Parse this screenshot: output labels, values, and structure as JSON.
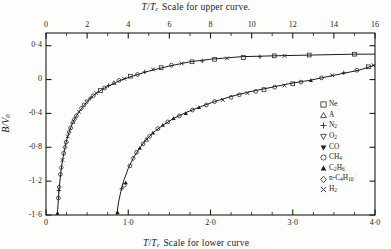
{
  "figure": {
    "top_axis_title": "Scale for upper curve.",
    "bottom_axis_title": "Scale for lower curve",
    "axis_symbol_numerator": "T",
    "axis_symbol_denominator": "T",
    "axis_symbol_denominator_sub": "c",
    "ylabel_numerator": "B",
    "ylabel_denominator": "V",
    "ylabel_denominator_sub": "0"
  },
  "legend": {
    "entries": [
      {
        "symbol": "open-square",
        "label": "Ne"
      },
      {
        "symbol": "open-triangle-up",
        "label": "A"
      },
      {
        "symbol": "plus",
        "label": "N2"
      },
      {
        "symbol": "open-triangle-down",
        "label": "O2"
      },
      {
        "symbol": "filled-triangle-down",
        "label": "CO"
      },
      {
        "symbol": "open-circle",
        "label": "CH4"
      },
      {
        "symbol": "filled-triangle-up",
        "label": "C2H6"
      },
      {
        "symbol": "open-diamond",
        "label": "n-C4H10"
      },
      {
        "symbol": "cross",
        "label": "H2"
      }
    ]
  },
  "chart_data": {
    "type": "scatter",
    "xlabel": "T/Tc",
    "ylabel": "B/V0",
    "grid": false,
    "legend_position": "right",
    "axes": {
      "top": {
        "label": "T/Tc Scale for upper curve.",
        "range": [
          0,
          16
        ],
        "ticks": [
          0,
          2,
          4,
          6,
          8,
          10,
          12,
          14,
          16
        ],
        "tick_labels": [
          "0",
          "2",
          "4",
          "6",
          "8",
          "10",
          "12",
          "14",
          "16"
        ],
        "minor_tick_step": 1
      },
      "bottom": {
        "label": "T/Tc Scale for lower curve",
        "range": [
          0,
          4
        ],
        "ticks": [
          0,
          1.0,
          2.0,
          3.0,
          4.0
        ],
        "tick_labels": [
          "0",
          "1·0",
          "2·0",
          "3·0",
          "4·0"
        ],
        "minor_tick_step": 0.25
      },
      "left": {
        "label": "B/V0",
        "range": [
          -1.6,
          0.55
        ],
        "ticks": [
          0.4,
          0,
          -0.4,
          -0.8,
          -1.2,
          -1.6
        ],
        "tick_labels": [
          "0·4",
          "0",
          "-0·4",
          "-0·8",
          "-1·2",
          "-1·6"
        ]
      }
    },
    "series": [
      {
        "name": "upper curve",
        "axis": "top",
        "line": [
          [
            0.55,
            -1.6
          ],
          [
            0.6,
            -1.42
          ],
          [
            0.65,
            -1.26
          ],
          [
            0.72,
            -1.1
          ],
          [
            0.8,
            -0.96
          ],
          [
            0.9,
            -0.83
          ],
          [
            1.0,
            -0.72
          ],
          [
            1.15,
            -0.6
          ],
          [
            1.3,
            -0.51
          ],
          [
            1.5,
            -0.42
          ],
          [
            1.7,
            -0.35
          ],
          [
            2.0,
            -0.26
          ],
          [
            2.3,
            -0.19
          ],
          [
            2.7,
            -0.12
          ],
          [
            3.1,
            -0.07
          ],
          [
            3.6,
            -0.01
          ],
          [
            4.2,
            0.04
          ],
          [
            5.0,
            0.1
          ],
          [
            6.0,
            0.16
          ],
          [
            7.0,
            0.21
          ],
          [
            8.0,
            0.24
          ],
          [
            9.5,
            0.27
          ],
          [
            11.0,
            0.28
          ],
          [
            13.0,
            0.29
          ],
          [
            15.0,
            0.3
          ],
          [
            16.0,
            0.3
          ]
        ],
        "points": [
          [
            0.56,
            -1.58,
            "filled-triangle-up"
          ],
          [
            0.6,
            -1.4,
            "open-circle"
          ],
          [
            0.62,
            -1.31,
            "plus"
          ],
          [
            0.64,
            -1.27,
            "open-diamond"
          ],
          [
            0.7,
            -1.12,
            "open-circle"
          ],
          [
            0.74,
            -1.04,
            "open-diamond"
          ],
          [
            0.8,
            -0.95,
            "cross"
          ],
          [
            0.86,
            -0.87,
            "open-circle"
          ],
          [
            0.92,
            -0.8,
            "open-diamond"
          ],
          [
            0.98,
            -0.74,
            "open-circle"
          ],
          [
            1.05,
            -0.67,
            "cross"
          ],
          [
            1.12,
            -0.62,
            "open-diamond"
          ],
          [
            1.2,
            -0.57,
            "open-circle"
          ],
          [
            1.3,
            -0.5,
            "open-triangle-up"
          ],
          [
            1.38,
            -0.47,
            "open-diamond"
          ],
          [
            1.48,
            -0.43,
            "open-circle"
          ],
          [
            1.6,
            -0.38,
            "cross"
          ],
          [
            1.72,
            -0.34,
            "open-diamond"
          ],
          [
            1.85,
            -0.3,
            "open-circle"
          ],
          [
            2.0,
            -0.26,
            "open-triangle-down"
          ],
          [
            2.15,
            -0.22,
            "plus"
          ],
          [
            2.3,
            -0.19,
            "open-circle"
          ],
          [
            2.45,
            -0.16,
            "cross"
          ],
          [
            2.65,
            -0.13,
            "open-square"
          ],
          [
            2.85,
            -0.1,
            "open-circle"
          ],
          [
            3.05,
            -0.07,
            "plus"
          ],
          [
            3.3,
            -0.04,
            "open-triangle-up"
          ],
          [
            3.55,
            -0.01,
            "open-circle"
          ],
          [
            3.8,
            0.01,
            "cross"
          ],
          [
            4.1,
            0.04,
            "open-square"
          ],
          [
            4.45,
            0.06,
            "open-circle"
          ],
          [
            4.8,
            0.09,
            "plus"
          ],
          [
            5.2,
            0.12,
            "cross"
          ],
          [
            5.6,
            0.14,
            "open-square"
          ],
          [
            6.1,
            0.17,
            "open-circle"
          ],
          [
            6.6,
            0.19,
            "cross"
          ],
          [
            7.1,
            0.21,
            "open-square"
          ],
          [
            7.6,
            0.22,
            "plus"
          ],
          [
            8.2,
            0.24,
            "open-square"
          ],
          [
            8.8,
            0.25,
            "cross"
          ],
          [
            9.6,
            0.26,
            "open-square"
          ],
          [
            10.4,
            0.27,
            "plus"
          ],
          [
            11.1,
            0.28,
            "open-square"
          ],
          [
            11.6,
            0.28,
            "cross"
          ],
          [
            12.8,
            0.29,
            "open-square"
          ],
          [
            15.0,
            0.3,
            "open-square"
          ]
        ]
      },
      {
        "name": "lower curve",
        "axis": "bottom",
        "line": [
          [
            0.86,
            -1.6
          ],
          [
            0.88,
            -1.46
          ],
          [
            0.91,
            -1.32
          ],
          [
            0.95,
            -1.18
          ],
          [
            1.0,
            -1.05
          ],
          [
            1.06,
            -0.93
          ],
          [
            1.13,
            -0.82
          ],
          [
            1.21,
            -0.72
          ],
          [
            1.3,
            -0.63
          ],
          [
            1.42,
            -0.54
          ],
          [
            1.55,
            -0.46
          ],
          [
            1.7,
            -0.39
          ],
          [
            1.88,
            -0.32
          ],
          [
            2.05,
            -0.26
          ],
          [
            2.25,
            -0.2
          ],
          [
            2.45,
            -0.15
          ],
          [
            2.7,
            -0.1
          ],
          [
            2.95,
            -0.05
          ],
          [
            3.2,
            -0.01
          ],
          [
            3.5,
            0.05
          ],
          [
            3.8,
            0.11
          ],
          [
            4.0,
            0.17
          ]
        ],
        "points": [
          [
            0.87,
            -1.57,
            "filled-triangle-up"
          ],
          [
            0.92,
            -1.29,
            "plus"
          ],
          [
            0.95,
            -1.25,
            "open-circle"
          ],
          [
            0.97,
            -1.22,
            "filled-triangle-up"
          ],
          [
            1.02,
            -1.02,
            "open-circle"
          ],
          [
            1.06,
            -0.93,
            "open-diamond"
          ],
          [
            1.1,
            -0.86,
            "open-circle"
          ],
          [
            1.14,
            -0.81,
            "filled-triangle-up"
          ],
          [
            1.18,
            -0.76,
            "open-circle"
          ],
          [
            1.22,
            -0.71,
            "open-triangle-up"
          ],
          [
            1.26,
            -0.67,
            "open-circle"
          ],
          [
            1.3,
            -0.63,
            "filled-triangle-up"
          ],
          [
            1.36,
            -0.58,
            "open-circle"
          ],
          [
            1.42,
            -0.54,
            "filled-triangle-up"
          ],
          [
            1.48,
            -0.5,
            "open-circle"
          ],
          [
            1.55,
            -0.46,
            "filled-triangle-up"
          ],
          [
            1.62,
            -0.43,
            "open-circle"
          ],
          [
            1.7,
            -0.4,
            "filled-triangle-up"
          ],
          [
            1.78,
            -0.36,
            "open-circle"
          ],
          [
            1.86,
            -0.33,
            "filled-triangle-up"
          ],
          [
            1.95,
            -0.3,
            "open-circle"
          ],
          [
            2.05,
            -0.26,
            "open-circle"
          ],
          [
            2.15,
            -0.24,
            "cross"
          ],
          [
            2.25,
            -0.21,
            "open-circle"
          ],
          [
            2.35,
            -0.18,
            "open-circle"
          ],
          [
            2.45,
            -0.16,
            "cross"
          ],
          [
            2.55,
            -0.14,
            "open-circle"
          ],
          [
            2.65,
            -0.12,
            "open-square"
          ],
          [
            2.78,
            -0.09,
            "open-circle"
          ],
          [
            2.9,
            -0.07,
            "cross"
          ],
          [
            3.0,
            -0.05,
            "open-square"
          ],
          [
            3.1,
            -0.03,
            "open-circle"
          ],
          [
            3.22,
            -0.01,
            "filled-triangle-up"
          ],
          [
            3.35,
            0.02,
            "open-circle"
          ],
          [
            3.48,
            0.05,
            "cross"
          ],
          [
            3.62,
            0.08,
            "plus"
          ],
          [
            3.78,
            0.11,
            "open-circle"
          ],
          [
            3.92,
            0.15,
            "open-square"
          ],
          [
            3.98,
            0.17,
            "cross"
          ]
        ]
      }
    ]
  }
}
